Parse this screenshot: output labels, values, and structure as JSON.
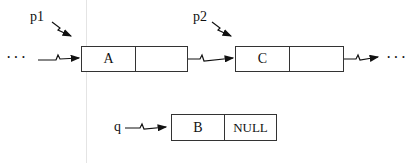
{
  "diagram": {
    "type": "linked-list-insertion",
    "pointers": [
      {
        "id": "p1",
        "label": "p1",
        "points_to": "A"
      },
      {
        "id": "p2",
        "label": "p2",
        "points_to": "C"
      },
      {
        "id": "q",
        "label": "q",
        "points_to": "B"
      }
    ],
    "nodes": [
      {
        "id": "A",
        "data": "A",
        "next": "",
        "next_points_to": "C"
      },
      {
        "id": "C",
        "data": "C",
        "next": "",
        "next_points_to": "..."
      },
      {
        "id": "B",
        "data": "B",
        "next": "NULL",
        "next_points_to": null
      }
    ],
    "ellipsis_left": "···",
    "ellipsis_right": "···"
  }
}
